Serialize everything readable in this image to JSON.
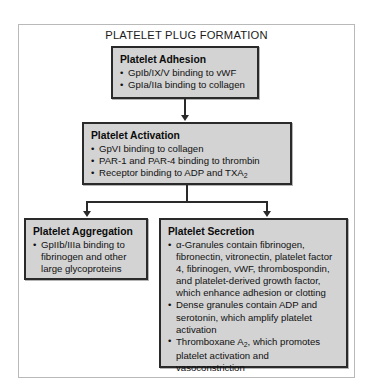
{
  "diagram": {
    "title": "PLATELET PLUG FORMATION",
    "type": "flowchart",
    "colors": {
      "node_fill": "#d3d3d3",
      "node_border": "#2a2a2a",
      "frame_border": "#b9b9b9",
      "text": "#111111",
      "page_background": "#ffffff"
    },
    "nodes": {
      "adhesion": {
        "title": "Platelet Adhesion",
        "bullets": [
          "GpIb/IX/V binding to vWF",
          "GpIa/IIa binding to collagen"
        ]
      },
      "activation": {
        "title": "Platelet Activation",
        "bullets": [
          "GpVI binding to collagen",
          "PAR-1 and PAR-4 binding to thrombin",
          "Receptor binding to ADP and TXA2"
        ]
      },
      "aggregation": {
        "title": "Platelet Aggregation",
        "bullets": [
          "GpIIb/IIIa binding to fibrinogen and other large glycoproteins"
        ]
      },
      "secretion": {
        "title": "Platelet Secretion",
        "bullets": [
          "α-Granules contain fibrinogen, fibronectin, vitronectin, platelet factor 4, fibrinogen, vWF, thrombospondin, and platelet-derived growth factor, which enhance adhesion or clotting",
          "Dense granules contain ADP and serotonin, which amplify platelet activation",
          "Thromboxane A2, which promotes platelet activation and vasoconstriction"
        ]
      }
    },
    "connections": [
      {
        "from": "adhesion",
        "to": "activation",
        "style": "arrow-down"
      },
      {
        "from": "activation",
        "to": "aggregation",
        "style": "arrow-down-branch-left"
      },
      {
        "from": "activation",
        "to": "secretion",
        "style": "arrow-down-branch-right"
      }
    ]
  },
  "text_fragments": {
    "activation_b3_pre": "Receptor binding to ADP and TXA",
    "activation_b3_sub": "2",
    "secretion_b1_alpha": "α",
    "secretion_b1_l1": "-Granules contain fibrinogen,",
    "secretion_b1_l2": "fibronectin, vitronectin, platelet factor",
    "secretion_b1_l3": "4, fibrinogen, vWF, thrombospondin,",
    "secretion_b1_l4": "and platelet-derived growth factor,",
    "secretion_b1_l5": "which enhance adhesion or clotting",
    "secretion_b2_l1": "Dense granules contain ADP and",
    "secretion_b2_l2": "serotonin, which amplify platelet",
    "secretion_b2_l3": "activation",
    "secretion_b3_pre": "Thromboxane A",
    "secretion_b3_sub": "2",
    "secretion_b3_post": ", which promotes",
    "secretion_b3_l2": "platelet activation and vasoconstriction",
    "aggregation_b1_l1": "GpIIb/IIIa binding to",
    "aggregation_b1_l2": "fibrinogen and other",
    "aggregation_b1_l3": "large glycoproteins"
  }
}
